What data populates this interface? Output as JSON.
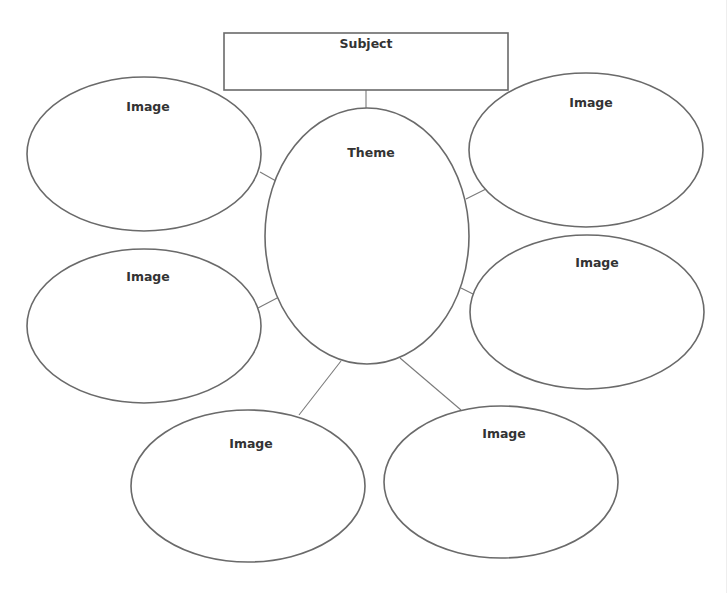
{
  "diagram": {
    "type": "concept-map",
    "subject": {
      "label": "Subject",
      "shape": "rectangle"
    },
    "theme": {
      "label": "Theme",
      "shape": "ellipse"
    },
    "images": [
      {
        "label": "Image",
        "position": "top-left"
      },
      {
        "label": "Image",
        "position": "top-right"
      },
      {
        "label": "Image",
        "position": "middle-left"
      },
      {
        "label": "Image",
        "position": "middle-right"
      },
      {
        "label": "Image",
        "position": "bottom-left"
      },
      {
        "label": "Image",
        "position": "bottom-right"
      }
    ],
    "colors": {
      "stroke": "#6a6a6a",
      "text": "#333333",
      "background": "#ffffff"
    }
  }
}
